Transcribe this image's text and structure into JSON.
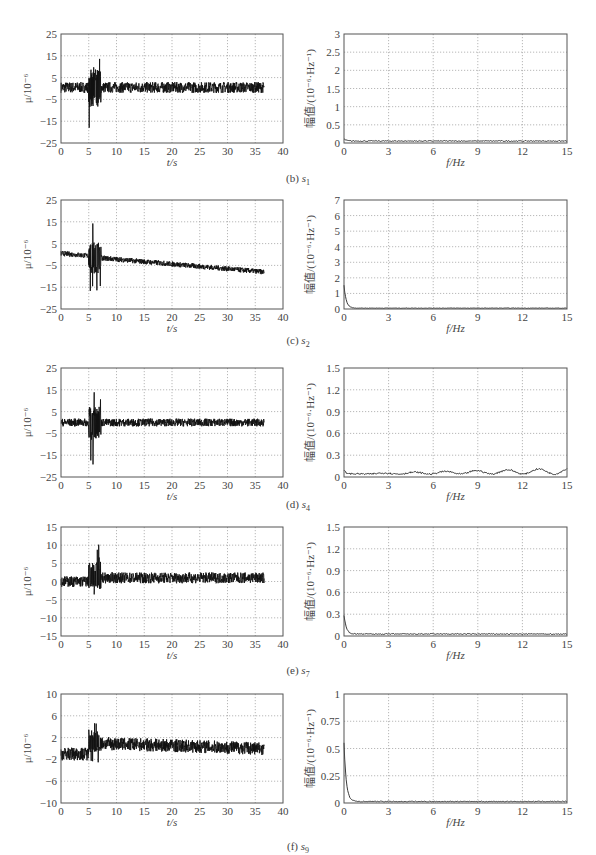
{
  "figure": {
    "rows": [
      {
        "id": "b",
        "caption_prefix": "(b)",
        "sensor": "s",
        "sensor_sub": "1"
      },
      {
        "id": "c",
        "caption_prefix": "(c)",
        "sensor": "s",
        "sensor_sub": "2"
      },
      {
        "id": "d",
        "caption_prefix": "(d)",
        "sensor": "s",
        "sensor_sub": "4"
      },
      {
        "id": "e",
        "caption_prefix": "(e)",
        "sensor": "s",
        "sensor_sub": "7"
      },
      {
        "id": "f",
        "caption_prefix": "(f)",
        "sensor": "s",
        "sensor_sub": "9"
      }
    ]
  },
  "chart_data": [
    {
      "panel": "b-time",
      "type": "line",
      "title": "",
      "xlabel": "t/s",
      "ylabel": "μ/10⁻⁶",
      "xlim": [
        0,
        40
      ],
      "ylim": [
        -25,
        25
      ],
      "xticks": [
        0,
        5,
        10,
        15,
        20,
        25,
        30,
        35,
        40
      ],
      "yticks": [
        -25,
        -15,
        -5,
        5,
        15,
        25
      ],
      "grid": true,
      "description": "strain time history; band ~[-2,3] with burst at 5-7 s peaking ~+21/-22",
      "baseline": [
        0.5,
        0.5
      ],
      "band": 2.5,
      "burst": {
        "t": [
          5,
          7.2
        ],
        "max": 21,
        "min": -22
      },
      "end_t": 36.6
    },
    {
      "panel": "b-freq",
      "type": "line",
      "title": "",
      "xlabel": "f/Hz",
      "ylabel": "幅值/(10⁻⁶·Hz⁻¹)",
      "xlim": [
        0,
        15
      ],
      "ylim": [
        0,
        3
      ],
      "xticks": [
        0,
        3,
        6,
        9,
        12,
        15
      ],
      "yticks": [
        0,
        0.5,
        1,
        1.5,
        2,
        2.5,
        3
      ],
      "grid": true,
      "description": "amplitude spectrum near zero, ~0.02-0.08 across band",
      "peak0": 0.1,
      "floor": 0.04
    },
    {
      "panel": "c-time",
      "type": "line",
      "title": "",
      "xlabel": "t/s",
      "ylabel": "μ/10⁻⁶",
      "xlim": [
        0,
        40
      ],
      "ylim": [
        -25,
        25
      ],
      "xticks": [
        0,
        5,
        10,
        15,
        20,
        25,
        30,
        35,
        40
      ],
      "yticks": [
        -25,
        -15,
        -5,
        5,
        15,
        25
      ],
      "grid": true,
      "description": "drifting baseline from ~0 to ~-8 at 36.6 s; burst at 5-7 s peak ~+16/-20",
      "baseline": [
        0,
        -8
      ],
      "band": 1.2,
      "burst": {
        "t": [
          5,
          7.2
        ],
        "max": 16,
        "min": -20
      },
      "end_t": 36.6
    },
    {
      "panel": "c-freq",
      "type": "line",
      "title": "",
      "xlabel": "f/Hz",
      "ylabel": "幅值/(10⁻⁶·Hz⁻¹)",
      "xlim": [
        0,
        15
      ],
      "ylim": [
        0,
        7
      ],
      "xticks": [
        0,
        3,
        6,
        9,
        12,
        15
      ],
      "yticks": [
        0,
        1,
        2,
        3,
        4,
        5,
        6,
        7
      ],
      "grid": true,
      "description": "large DC component ~1.5 decaying quickly to ~0.05",
      "peak0": 1.5,
      "floor": 0.04
    },
    {
      "panel": "d-time",
      "type": "line",
      "title": "",
      "xlabel": "t/s",
      "ylabel": "μ/10⁻⁶",
      "xlim": [
        0,
        40
      ],
      "ylim": [
        -25,
        25
      ],
      "xticks": [
        0,
        5,
        10,
        15,
        20,
        25,
        30,
        35,
        40
      ],
      "yticks": [
        -25,
        -15,
        -5,
        5,
        15,
        25
      ],
      "grid": true,
      "description": "band ~[-2,2]; burst at 5-7 s peaking ~+18/-20",
      "baseline": [
        0,
        0
      ],
      "band": 1.8,
      "burst": {
        "t": [
          5,
          7.2
        ],
        "max": 18,
        "min": -20
      },
      "end_t": 36.6
    },
    {
      "panel": "d-freq",
      "type": "line",
      "title": "",
      "xlabel": "f/Hz",
      "ylabel": "幅值/(10⁻⁶·Hz⁻¹)",
      "xlim": [
        0,
        15
      ],
      "ylim": [
        0,
        1.5
      ],
      "xticks": [
        0,
        3,
        6,
        9,
        12,
        15
      ],
      "yticks": [
        0,
        0.3,
        0.6,
        0.9,
        1.2,
        1.5
      ],
      "grid": true,
      "description": "low amplitude 0.01-0.1 with rise to ~0.1 near 15 Hz",
      "peak0": 0.08,
      "floor": 0.03
    },
    {
      "panel": "e-time",
      "type": "line",
      "title": "",
      "xlabel": "t/s",
      "ylabel": "μ/10⁻⁶",
      "xlim": [
        0,
        40
      ],
      "ylim": [
        -15,
        15
      ],
      "xticks": [
        0,
        5,
        10,
        15,
        20,
        25,
        30,
        35,
        40
      ],
      "yticks": [
        -15,
        -10,
        -5,
        0,
        5,
        10,
        15
      ],
      "grid": true,
      "description": "band ~[-1.5,1.5] then shifted to ~[-0.5,2.5] after burst at 5-7 s (peak ~+12/-6)",
      "baseline": [
        0,
        1
      ],
      "band": 1.5,
      "burst": {
        "t": [
          5,
          7.2
        ],
        "max": 12,
        "min": -6.5
      },
      "end_t": 36.6
    },
    {
      "panel": "e-freq",
      "type": "line",
      "title": "",
      "xlabel": "f/Hz",
      "ylabel": "幅值/(10⁻⁶·Hz⁻¹)",
      "xlim": [
        0,
        15
      ],
      "ylim": [
        0,
        1.5
      ],
      "xticks": [
        0,
        3,
        6,
        9,
        12,
        15
      ],
      "yticks": [
        0,
        0.3,
        0.6,
        0.9,
        1.2,
        1.5
      ],
      "grid": true,
      "description": "DC ~0.28 decaying to ~0.02",
      "peak0": 0.28,
      "floor": 0.02
    },
    {
      "panel": "f-time",
      "type": "line",
      "title": "",
      "xlabel": "t/s",
      "ylabel": "μ/10⁻⁶",
      "xlim": [
        0,
        40
      ],
      "ylim": [
        -10,
        10
      ],
      "xticks": [
        0,
        5,
        10,
        15,
        20,
        25,
        30,
        35,
        40
      ],
      "yticks": [
        -10,
        -6,
        -2,
        2,
        6,
        10
      ],
      "grid": true,
      "description": "baseline ~-1 before 5 s, jumps to ~1 and slowly drifts to ~0 at 36.6 s; burst peak ~+7/-3",
      "baseline": [
        -1,
        0
      ],
      "band": 1.2,
      "burst": {
        "t": [
          5,
          7.2
        ],
        "max": 7,
        "min": -3
      },
      "end_t": 36.6
    },
    {
      "panel": "f-freq",
      "type": "line",
      "title": "",
      "xlabel": "f/Hz",
      "ylabel": "幅值/(10⁻⁶·Hz⁻¹)",
      "xlim": [
        0,
        15
      ],
      "ylim": [
        0,
        1
      ],
      "xticks": [
        0,
        3,
        6,
        9,
        12,
        15
      ],
      "yticks": [
        0,
        0.25,
        0.5,
        0.75,
        1
      ],
      "grid": true,
      "description": "DC ~0.55 decaying rapidly to ~0.01",
      "peak0": 0.55,
      "floor": 0.01
    }
  ]
}
